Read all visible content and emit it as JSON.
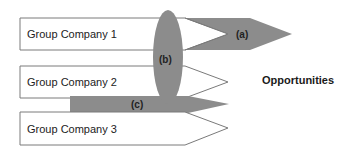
{
  "diagram": {
    "companies": [
      {
        "label": "Group Company 1"
      },
      {
        "label": "Group Company 2"
      },
      {
        "label": "Group Company 3"
      }
    ],
    "markers": {
      "a": "(a)",
      "b": "(b)",
      "c": "(c)"
    },
    "target_label": "Opportunities",
    "colors": {
      "arrow_fill": "#8c8c8c",
      "box_fill": "#ffffff",
      "box_stroke": "#7a7a7a",
      "text": "#222222"
    }
  }
}
